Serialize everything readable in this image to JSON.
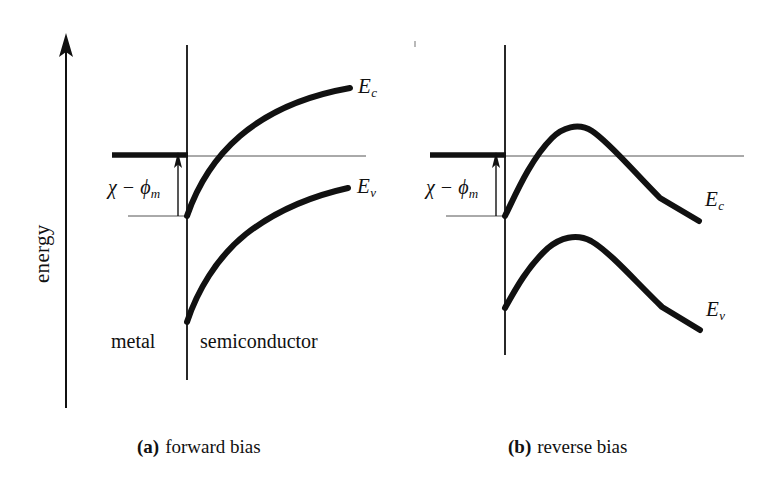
{
  "figure": {
    "axis": {
      "label": "energy",
      "direction": "up"
    },
    "panels": [
      {
        "id": "a",
        "caption_tag": "(a)",
        "caption_text": "forward bias",
        "region_left_label": "metal",
        "region_right_label": "semiconductor",
        "barrier_label_chi": "χ",
        "barrier_label_minus": "−",
        "barrier_label_phi": "ϕ",
        "barrier_label_sub": "m",
        "conduction_band_label": "E",
        "conduction_band_sub": "c",
        "valence_band_label": "E",
        "valence_band_sub": "v"
      },
      {
        "id": "b",
        "caption_tag": "(b)",
        "caption_text": "reverse bias",
        "barrier_label_chi": "χ",
        "barrier_label_minus": "−",
        "barrier_label_phi": "ϕ",
        "barrier_label_sub": "m",
        "conduction_band_label": "E",
        "conduction_band_sub": "c",
        "valence_band_label": "E",
        "valence_band_sub": "v"
      }
    ],
    "colors": {
      "ink": "#111111",
      "thin_line": "#444444",
      "background": "#ffffff"
    }
  }
}
